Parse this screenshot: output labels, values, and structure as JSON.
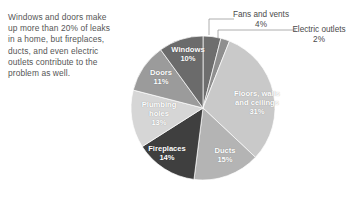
{
  "caption": {
    "text": "Windows and doors make up more than 20% of leaks in a home, but fireplaces, ducts, and even electric outlets contribute to the problem as well."
  },
  "chart_data": {
    "type": "pie",
    "title": "",
    "unit": "%",
    "legend": "inline-labels",
    "start_angle_deg": 0,
    "direction": "clockwise",
    "categories": [
      "Fans and vents",
      "Electric outlets",
      "Floors, walls and ceilings",
      "Ducts",
      "Fireplaces",
      "Plumbing holes",
      "Doors",
      "Windows"
    ],
    "values": [
      4,
      2,
      31,
      15,
      14,
      13,
      11,
      10
    ],
    "colors": [
      "#6e6e6e",
      "#8f8f8f",
      "#c9c9c9",
      "#b4b4b4",
      "#3f3f3f",
      "#d6d6d6",
      "#9b9b9b",
      "#6b6b6b"
    ],
    "slices": [
      {
        "name": "Fans and vents",
        "value": 4,
        "label": "Fans and vents",
        "pct": "4%",
        "placement": "callout",
        "color": "#6e6e6e"
      },
      {
        "name": "Electric outlets",
        "value": 2,
        "label": "Electric outlets",
        "pct": "2%",
        "placement": "callout",
        "color": "#8f8f8f"
      },
      {
        "name": "Floors, walls and ceilings",
        "value": 31,
        "label_line1": "Floors, walls",
        "label_line2": "and ceilings",
        "pct": "31%",
        "placement": "inside",
        "color": "#c9c9c9"
      },
      {
        "name": "Ducts",
        "value": 15,
        "label": "Ducts",
        "pct": "15%",
        "placement": "inside",
        "color": "#b4b4b4"
      },
      {
        "name": "Fireplaces",
        "value": 14,
        "label": "Fireplaces",
        "pct": "14%",
        "placement": "inside",
        "color": "#3f3f3f"
      },
      {
        "name": "Plumbing holes",
        "value": 13,
        "label_line1": "Plumbing",
        "label_line2": "holes",
        "pct": "13%",
        "placement": "inside",
        "color": "#d6d6d6"
      },
      {
        "name": "Doors",
        "value": 11,
        "label": "Doors",
        "pct": "11%",
        "placement": "inside",
        "color": "#9b9b9b"
      },
      {
        "name": "Windows",
        "value": 10,
        "label": "Windows",
        "pct": "10%",
        "placement": "inside",
        "color": "#6b6b6b"
      }
    ]
  },
  "labels": {
    "fans_name": "Fans and vents",
    "fans_pct": "4%",
    "outlets_name": "Electric outlets",
    "outlets_pct": "2%",
    "floors_l1": "Floors, walls",
    "floors_l2": "and ceilings",
    "floors_pct": "31%",
    "ducts_name": "Ducts",
    "ducts_pct": "15%",
    "fireplaces_name": "Fireplaces",
    "fireplaces_pct": "14%",
    "plumbing_l1": "Plumbing",
    "plumbing_l2": "holes",
    "plumbing_pct": "13%",
    "doors_name": "Doors",
    "doors_pct": "11%",
    "windows_name": "Windows",
    "windows_pct": "10%"
  }
}
